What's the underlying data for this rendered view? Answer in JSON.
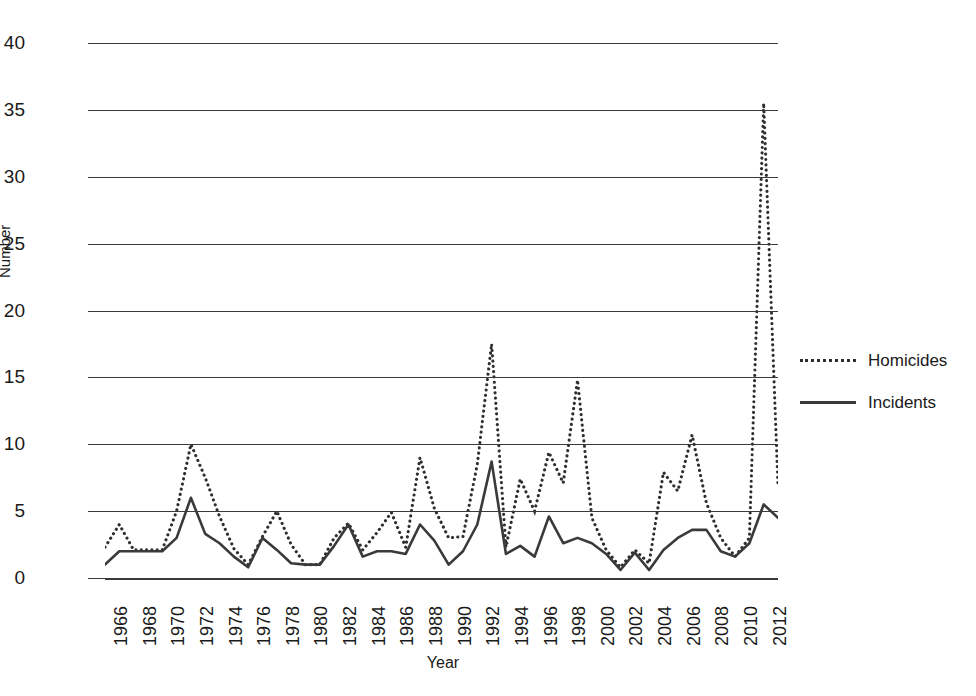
{
  "chart_data": {
    "type": "line",
    "title": "",
    "xlabel": "Year",
    "ylabel": "Number",
    "xlim": [
      1966,
      2013
    ],
    "ylim": [
      0,
      40
    ],
    "ytick_step": 5,
    "xtick_step": 2,
    "grid": "horizontal",
    "legend_position": "right",
    "x": [
      1966,
      1967,
      1968,
      1969,
      1970,
      1971,
      1972,
      1973,
      1974,
      1975,
      1976,
      1977,
      1978,
      1979,
      1980,
      1981,
      1982,
      1983,
      1984,
      1985,
      1986,
      1987,
      1988,
      1989,
      1990,
      1991,
      1992,
      1993,
      1994,
      1995,
      1996,
      1997,
      1998,
      1999,
      2000,
      2001,
      2002,
      2003,
      2004,
      2005,
      2006,
      2007,
      2008,
      2009,
      2010,
      2011,
      2012,
      2013
    ],
    "series": [
      {
        "name": "Homicides",
        "style": "dotted",
        "color": "#2e2e2e",
        "values": [
          2.3,
          4.0,
          2.1,
          2.1,
          2.1,
          5.0,
          10.0,
          7.5,
          4.6,
          2.2,
          1.0,
          3.1,
          5.0,
          2.5,
          1.0,
          1.0,
          3.0,
          4.1,
          2.1,
          3.4,
          4.9,
          2.3,
          9.0,
          5.2,
          3.0,
          3.1,
          8.5,
          17.5,
          2.3,
          7.4,
          5.0,
          9.4,
          7.1,
          14.8,
          4.5,
          2.1,
          0.8,
          2.1,
          1.1,
          7.9,
          6.5,
          10.7,
          5.6,
          3.0,
          1.6,
          3.0,
          35.5,
          6.8
        ]
      },
      {
        "name": "Incidents",
        "style": "solid",
        "color": "#3a3a3a",
        "values": [
          1.0,
          2.0,
          2.0,
          2.0,
          2.0,
          3.0,
          6.0,
          3.3,
          2.6,
          1.6,
          0.8,
          3.0,
          2.1,
          1.1,
          1.0,
          1.0,
          2.4,
          4.0,
          1.6,
          2.0,
          2.0,
          1.8,
          4.0,
          2.8,
          1.0,
          2.0,
          4.0,
          8.7,
          1.8,
          2.4,
          1.6,
          4.6,
          2.6,
          3.0,
          2.6,
          1.8,
          0.6,
          1.9,
          0.6,
          2.1,
          3.0,
          3.6,
          3.6,
          2.0,
          1.6,
          2.6,
          5.5,
          4.5
        ]
      }
    ],
    "ytick_labels": [
      "0",
      "5",
      "10",
      "15",
      "20",
      "25",
      "30",
      "35",
      "40"
    ],
    "xtick_labels": [
      "1966",
      "1968",
      "1970",
      "1972",
      "1974",
      "1976",
      "1978",
      "1980",
      "1982",
      "1984",
      "1986",
      "1988",
      "1990",
      "1992",
      "1994",
      "1996",
      "1998",
      "2000",
      "2002",
      "2004",
      "2006",
      "2008",
      "2010",
      "2012"
    ]
  },
  "axes": {
    "y_title": "Number",
    "x_title": "Year"
  },
  "legend": {
    "items": [
      {
        "label": "Homicides",
        "style": "dotted"
      },
      {
        "label": "Incidents",
        "style": "solid"
      }
    ]
  }
}
